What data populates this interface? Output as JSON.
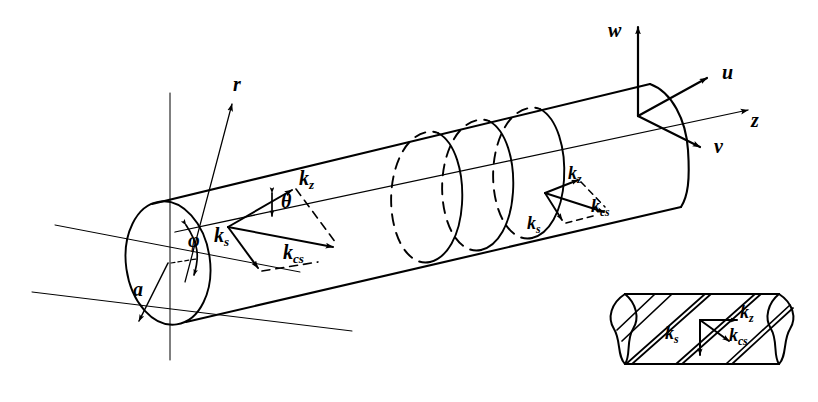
{
  "figure": {
    "kind": "line-diagram",
    "background_color": "#ffffff",
    "stroke_color": "#000000"
  },
  "axes": {
    "w": "w",
    "u": "u",
    "v": "v",
    "z": "z",
    "r": "r"
  },
  "angles": {
    "theta": "θ",
    "phi": "φ"
  },
  "radius": {
    "label": "a"
  },
  "vectors": {
    "k_base": "k",
    "sub_z": "z",
    "sub_s": "s",
    "sub_cs": "cs"
  },
  "triad_left": {
    "kz": "k",
    "kz_sub": "z",
    "ks": "k",
    "ks_sub": "s",
    "kcs": "k",
    "kcs_sub": "cs"
  },
  "triad_right": {
    "kz": "k",
    "kz_sub": "z",
    "ks": "k",
    "ks_sub": "s",
    "kcs": "k",
    "kcs_sub": "cs"
  },
  "inset": {
    "kz": "k",
    "kz_sub": "z",
    "ks": "k",
    "ks_sub": "s",
    "kcs": "k",
    "kcs_sub": "cs"
  }
}
